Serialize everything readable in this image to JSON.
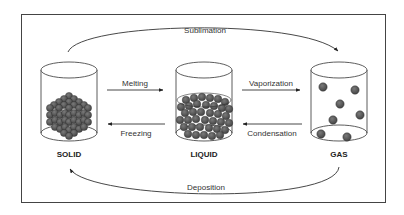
{
  "diagram": {
    "states": [
      {
        "id": "solid",
        "label": "SOLID"
      },
      {
        "id": "liquid",
        "label": "LIQUID"
      },
      {
        "id": "gas",
        "label": "GAS"
      }
    ],
    "transitions": {
      "sublimation": {
        "label": "Sublimation",
        "from": "SOLID",
        "to": "GAS"
      },
      "melting": {
        "label": "Melting",
        "from": "SOLID",
        "to": "LIQUID"
      },
      "freezing": {
        "label": "Freezing",
        "from": "LIQUID",
        "to": "SOLID"
      },
      "vaporization": {
        "label": "Vaporization",
        "from": "LIQUID",
        "to": "GAS"
      },
      "condensation": {
        "label": "Condensation",
        "from": "GAS",
        "to": "LIQUID"
      },
      "deposition": {
        "label": "Deposition",
        "from": "GAS",
        "to": "SOLID"
      }
    },
    "colors": {
      "particle": "#555555",
      "particle_stroke": "#2a2a2a",
      "line": "#333333",
      "border": "#444444"
    }
  }
}
